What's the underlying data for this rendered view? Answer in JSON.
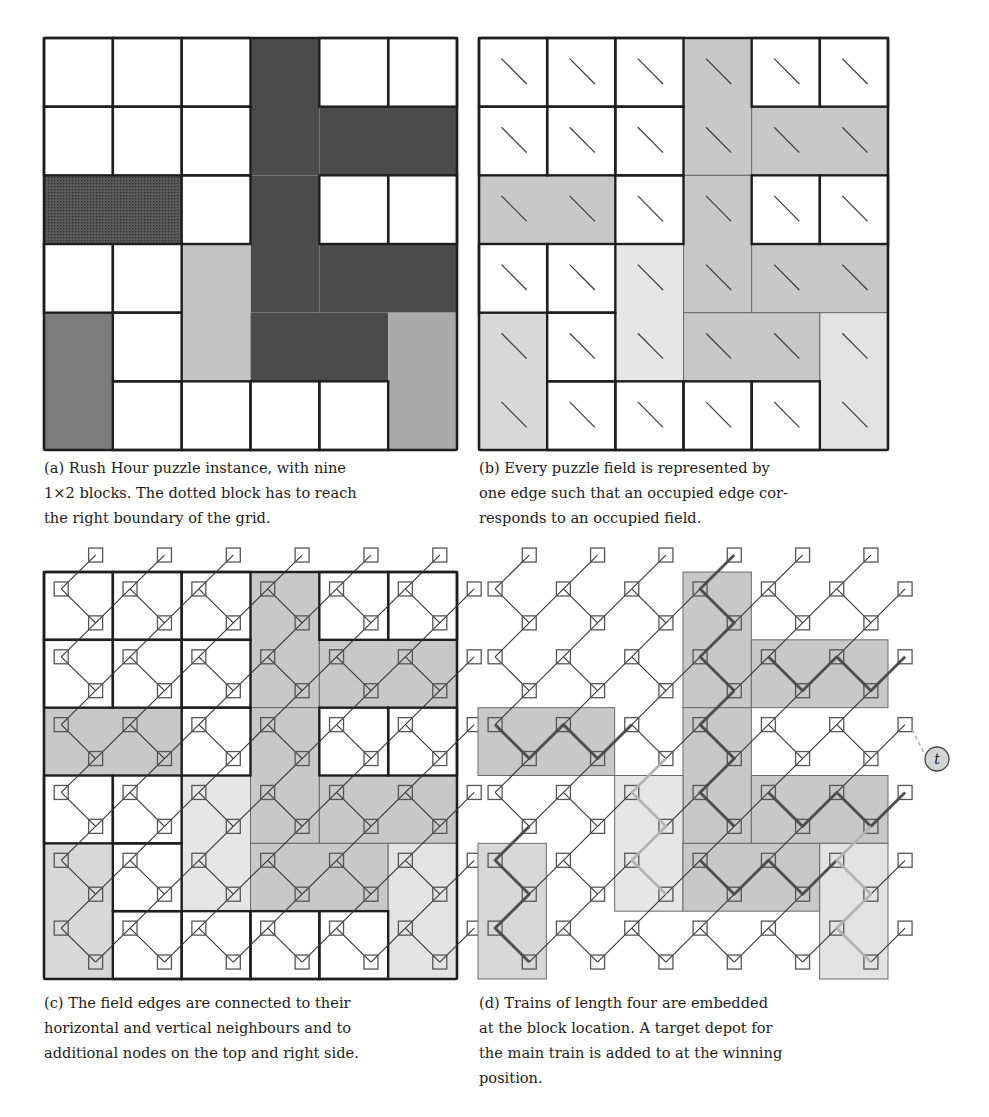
{
  "figure": {
    "grid_size": 6,
    "colors": {
      "dark_block": "#4b4b4b",
      "dotted_block": "#575757",
      "medium_block": "#7c7c7c",
      "light_block": "#c2c2c2",
      "medium_light_block": "#a9a9a9",
      "graph_dark_shade": "#c8c8c8",
      "graph_light_shade": "#e6e6e6",
      "graph_medium_shade": "#d8d8d8",
      "graph_medium_light_shade": "#e3e3e3",
      "line": "#1e1e1e",
      "node_stroke": "#555555",
      "train_dark": "#4a4a4a",
      "train_light": "#b8b8b8",
      "depot_fill": "#d4d4d4"
    },
    "blocks": [
      {
        "col": 3,
        "row": 0,
        "w": 1,
        "h": 2,
        "shade": "dark"
      },
      {
        "col": 4,
        "row": 1,
        "w": 2,
        "h": 1,
        "shade": "dark"
      },
      {
        "col": 0,
        "row": 2,
        "w": 2,
        "h": 1,
        "shade": "dotted",
        "main": true
      },
      {
        "col": 3,
        "row": 2,
        "w": 1,
        "h": 2,
        "shade": "dark"
      },
      {
        "col": 2,
        "row": 3,
        "w": 1,
        "h": 2,
        "shade": "light"
      },
      {
        "col": 4,
        "row": 3,
        "w": 2,
        "h": 1,
        "shade": "dark"
      },
      {
        "col": 0,
        "row": 4,
        "w": 1,
        "h": 2,
        "shade": "medium"
      },
      {
        "col": 3,
        "row": 4,
        "w": 2,
        "h": 1,
        "shade": "dark"
      },
      {
        "col": 5,
        "row": 4,
        "w": 1,
        "h": 2,
        "shade": "medium_light"
      }
    ],
    "panels": {
      "a": {
        "x": 44,
        "y": 38,
        "w": 413,
        "h": 412
      },
      "b": {
        "x": 479,
        "y": 38,
        "w": 409,
        "h": 412
      },
      "c": {
        "x": 44,
        "y": 572,
        "w": 413,
        "h": 407
      },
      "d": {
        "x": 478,
        "y": 572,
        "w": 410,
        "h": 407
      }
    },
    "depot": {
      "label": "t",
      "x": 937,
      "y": 759,
      "r": 12,
      "from_row": 2
    }
  },
  "captions": {
    "a": {
      "lines": [
        "(a) Rush Hour puzzle instance, with nine",
        "1×2 blocks. The dotted block has to reach",
        "the right boundary of the grid."
      ]
    },
    "b": {
      "lines": [
        "(b) Every puzzle field is represented by",
        "one edge such that an occupied edge cor-",
        "responds to an occupied field."
      ]
    },
    "c": {
      "lines": [
        "(c) The field edges are connected to their",
        "horizontal and vertical neighbours and to",
        "additional nodes on the top and right side."
      ]
    },
    "d": {
      "lines": [
        "(d) Trains of length four are embedded",
        "at the block location. A target depot for",
        "the main train is added to at the winning",
        "position."
      ]
    }
  }
}
